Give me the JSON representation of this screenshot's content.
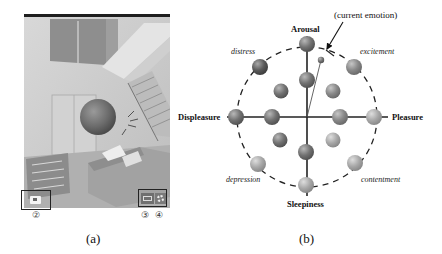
{
  "panel_a": {
    "caption": "(a)",
    "callouts": {
      "two": "②",
      "three": "③",
      "four": "④"
    },
    "buttons": [
      {
        "id": "2",
        "icon": "screen-icon"
      },
      {
        "id": "3",
        "icon": "keyboard-icon"
      },
      {
        "id": "4",
        "icon": "gear-icon"
      }
    ],
    "scene": "3D room with window, staircase, sofa, open box, and floating emotion sphere",
    "sphere_color": "#6b6b6b"
  },
  "panel_b": {
    "caption": "(b)",
    "axes": {
      "top": "Arousal",
      "bottom": "Sleepiness",
      "left": "Displeasure",
      "right": "Pleasure"
    },
    "quadrants": {
      "top_left": "distress",
      "top_right": "excitement",
      "bottom_left": "depression",
      "bottom_right": "contentment"
    },
    "pointer_label": "(current emotion)",
    "spheres": [
      {
        "name": "arousal",
        "x": 307,
        "y": 44,
        "shade": "#6e6e6e"
      },
      {
        "name": "distress",
        "x": 260,
        "y": 67,
        "shade": "#4e4e4e"
      },
      {
        "name": "excitement",
        "x": 354,
        "y": 67,
        "shade": "#7c7c7c"
      },
      {
        "name": "inner-top",
        "x": 307,
        "y": 80,
        "shade": "#6a6a6a"
      },
      {
        "name": "inner-upper-left",
        "x": 281,
        "y": 91,
        "shade": "#626262"
      },
      {
        "name": "inner-upper-right",
        "x": 333,
        "y": 91,
        "shade": "#747474"
      },
      {
        "name": "displeasure",
        "x": 236,
        "y": 117,
        "shade": "#666666"
      },
      {
        "name": "inner-left",
        "x": 272,
        "y": 117,
        "shade": "#6a6a6a"
      },
      {
        "name": "inner-right",
        "x": 340,
        "y": 117,
        "shade": "#7a7a7a"
      },
      {
        "name": "pleasure",
        "x": 374,
        "y": 117,
        "shade": "#8a8a8a"
      },
      {
        "name": "inner-lower-left",
        "x": 280,
        "y": 140,
        "shade": "#6c6c6c"
      },
      {
        "name": "inner-lower-right",
        "x": 333,
        "y": 140,
        "shade": "#8a8a8a"
      },
      {
        "name": "inner-bottom",
        "x": 306,
        "y": 152,
        "shade": "#6e6e6e"
      },
      {
        "name": "depression",
        "x": 258,
        "y": 164,
        "shade": "#a6a6a6"
      },
      {
        "name": "contentment",
        "x": 355,
        "y": 163,
        "shade": "#a0a0a0"
      },
      {
        "name": "sleepiness",
        "x": 306,
        "y": 185,
        "shade": "#a4a4a4"
      }
    ],
    "current_emotion": {
      "x": 321,
      "y": 60
    },
    "center": {
      "x": 307,
      "y": 117
    },
    "radius": 70
  }
}
